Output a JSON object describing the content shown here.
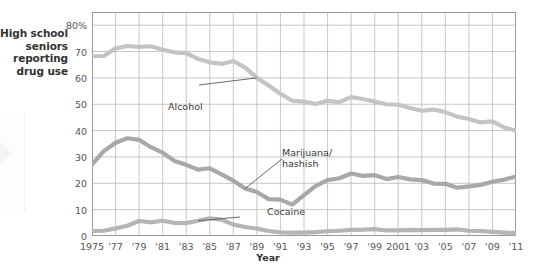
{
  "figure": {
    "y_caption": "High school\nseniors\nreporting\ndrug use",
    "x_axis_title": "Year"
  },
  "chart_data": {
    "type": "line",
    "title": "",
    "xlabel": "Year",
    "ylabel": "High school seniors reporting drug use",
    "xlim": [
      1975,
      2011
    ],
    "ylim": [
      0,
      85
    ],
    "grid": true,
    "legend": "inline-annotations",
    "y_ticks": [
      "0",
      "10",
      "20",
      "30",
      "40",
      "50",
      "60",
      "70",
      "80%"
    ],
    "y_tick_values": [
      0,
      10,
      20,
      30,
      40,
      50,
      60,
      70,
      80
    ],
    "x_ticks": [
      "1975",
      "'77",
      "'79",
      "'81",
      "'83",
      "'85",
      "'87",
      "'89",
      "'91",
      "'93",
      "'95",
      "'97",
      "'99",
      "2001",
      "'03",
      "'05",
      "'07",
      "'09",
      "'11"
    ],
    "x_tick_values": [
      1975,
      1977,
      1979,
      1981,
      1983,
      1985,
      1987,
      1989,
      1991,
      1993,
      1995,
      1997,
      1999,
      2001,
      2003,
      2005,
      2007,
      2009,
      2011
    ],
    "x": [
      1975,
      1976,
      1977,
      1978,
      1979,
      1980,
      1981,
      1982,
      1983,
      1984,
      1985,
      1986,
      1987,
      1988,
      1989,
      1990,
      1991,
      1992,
      1993,
      1994,
      1995,
      1996,
      1997,
      1998,
      1999,
      2000,
      2001,
      2002,
      2003,
      2004,
      2005,
      2006,
      2007,
      2008,
      2009,
      2010,
      2011
    ],
    "series": [
      {
        "name": "Alcohol",
        "label": "Alcohol",
        "color": "#c4c4c4",
        "values": [
          68.2,
          68.3,
          71.2,
          72.1,
          71.8,
          72.0,
          70.7,
          69.7,
          69.4,
          67.2,
          65.9,
          65.3,
          66.4,
          63.9,
          60.0,
          57.1,
          54.0,
          51.3,
          51.0,
          50.1,
          51.3,
          50.8,
          52.7,
          52.0,
          51.0,
          50.0,
          49.8,
          48.6,
          47.5,
          48.0,
          47.0,
          45.3,
          44.4,
          43.1,
          43.5,
          41.2,
          40.0
        ]
      },
      {
        "name": "Marijuana/hashish",
        "label": "Marijuana/\nhashish",
        "color": "#a8a8a8",
        "values": [
          27.1,
          32.2,
          35.4,
          37.1,
          36.5,
          33.7,
          31.6,
          28.5,
          27.0,
          25.2,
          25.7,
          23.4,
          21.0,
          18.0,
          16.7,
          14.0,
          13.8,
          11.9,
          15.5,
          19.0,
          21.2,
          21.9,
          23.7,
          22.8,
          23.1,
          21.6,
          22.4,
          21.5,
          21.2,
          19.9,
          19.8,
          18.3,
          18.8,
          19.4,
          20.6,
          21.4,
          22.6
        ]
      },
      {
        "name": "Cocaine",
        "label": "Cocaine",
        "color": "#b5b5b5",
        "values": [
          1.9,
          2.0,
          2.9,
          3.9,
          5.7,
          5.2,
          5.8,
          5.0,
          4.9,
          5.8,
          6.7,
          6.2,
          4.3,
          3.4,
          2.8,
          1.9,
          1.4,
          1.3,
          1.3,
          1.5,
          1.8,
          2.0,
          2.3,
          2.4,
          2.6,
          2.1,
          2.1,
          2.3,
          2.2,
          2.3,
          2.3,
          2.5,
          2.0,
          1.9,
          1.6,
          1.3,
          1.1
        ]
      }
    ],
    "annotations": [
      {
        "name": "alcohol-callout",
        "text": "Alcohol",
        "points_to_year": 1989
      },
      {
        "name": "marijuana-callout",
        "text": "Marijuana/\nhashish",
        "points_to_year": 1988
      },
      {
        "name": "cocaine-callout",
        "text": "Cocaine",
        "points_to_year": 1984
      }
    ]
  }
}
